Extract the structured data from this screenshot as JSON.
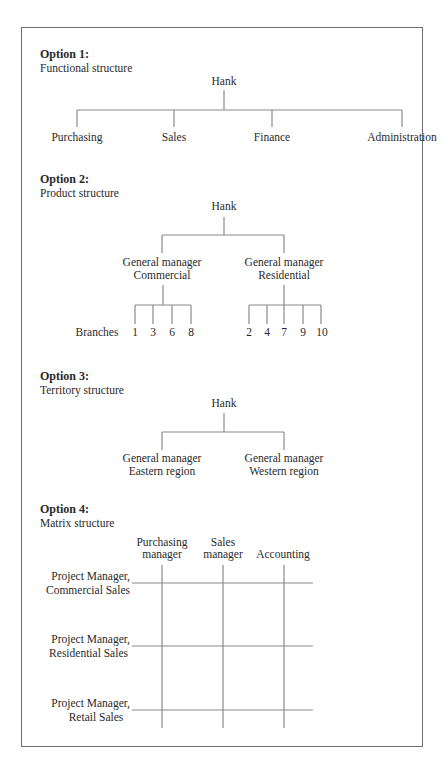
{
  "options": [
    {
      "title": "Option 1:",
      "subtitle": "Functional structure",
      "root": "Hank",
      "children": [
        "Purchasing",
        "Sales",
        "Finance",
        "Administration"
      ]
    },
    {
      "title": "Option 2:",
      "subtitle": "Product structure",
      "root": "Hank",
      "managers": [
        {
          "line1": "General manager",
          "line2": "Commercial",
          "branches": [
            "1",
            "3",
            "6",
            "8"
          ]
        },
        {
          "line1": "General manager",
          "line2": "Residential",
          "branches": [
            "2",
            "4",
            "7",
            "9",
            "10"
          ]
        }
      ],
      "branches_label": "Branches"
    },
    {
      "title": "Option 3:",
      "subtitle": "Territory structure",
      "root": "Hank",
      "managers": [
        {
          "line1": "General manager",
          "line2": "Eastern region"
        },
        {
          "line1": "General manager",
          "line2": "Western region"
        }
      ]
    },
    {
      "title": "Option 4:",
      "subtitle": "Matrix structure",
      "columns": [
        {
          "line1": "Purchasing",
          "line2": "manager"
        },
        {
          "line1": "Sales",
          "line2": "manager"
        },
        {
          "line1": "",
          "line2": "Accounting"
        }
      ],
      "rows": [
        {
          "line1": "Project Manager,",
          "line2": "Commercial Sales"
        },
        {
          "line1": "Project Manager,",
          "line2": "Residential Sales"
        },
        {
          "line1": "Project Manager,",
          "line2": "Retail Sales"
        }
      ]
    }
  ],
  "colors": {
    "line": "#8a8a8a",
    "border": "#6e6e6e",
    "text": "#2a2a2a"
  }
}
